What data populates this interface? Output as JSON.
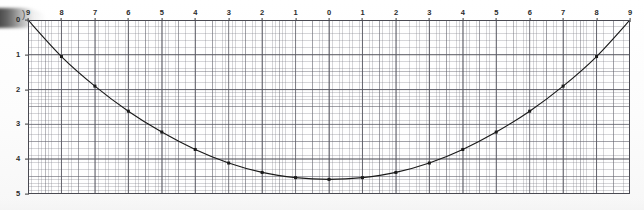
{
  "document": {
    "kind": "scanned-graph-paper",
    "artifact_label": ")",
    "paper_color": "#fdfdfd",
    "grid_color": "#7a7a86",
    "curve_color": "#1a1a1a"
  },
  "axes": {
    "x_ticks": [
      {
        "label": "9",
        "value": -9
      },
      {
        "label": "8",
        "value": -8
      },
      {
        "label": "7",
        "value": -7
      },
      {
        "label": "6",
        "value": -6
      },
      {
        "label": "5",
        "value": -5
      },
      {
        "label": "4",
        "value": -4
      },
      {
        "label": "3",
        "value": -3
      },
      {
        "label": "2",
        "value": -2
      },
      {
        "label": "1",
        "value": -1
      },
      {
        "label": "0",
        "value": 0
      },
      {
        "label": "1",
        "value": 1
      },
      {
        "label": "2",
        "value": 2
      },
      {
        "label": "3",
        "value": 3
      },
      {
        "label": "4",
        "value": 4
      },
      {
        "label": "5",
        "value": 5
      },
      {
        "label": "6",
        "value": 6
      },
      {
        "label": "7",
        "value": 7
      },
      {
        "label": "8",
        "value": 8
      },
      {
        "label": "9",
        "value": 9
      }
    ],
    "y_ticks": [
      {
        "label": "0",
        "value": 0
      },
      {
        "label": "1",
        "value": 1
      },
      {
        "label": "2",
        "value": 2
      },
      {
        "label": "3",
        "value": 3
      },
      {
        "label": "4",
        "value": 4
      },
      {
        "label": "5",
        "value": 5
      }
    ],
    "xlim": [
      -9,
      9
    ],
    "ylim": [
      0,
      5
    ],
    "y_inverted": true
  },
  "chart_data": {
    "type": "line",
    "title": "",
    "subtitle": "",
    "xlabel": "",
    "ylabel": "",
    "grid": true,
    "legend": "none",
    "xlim": [
      -9,
      9
    ],
    "ylim": [
      0,
      5
    ],
    "y_axis_direction": "downward",
    "x": [
      -9,
      -8,
      -7,
      -6,
      -5,
      -4,
      -3,
      -2,
      -1,
      0,
      1,
      2,
      3,
      4,
      5,
      6,
      7,
      8,
      9
    ],
    "categories": [
      "9",
      "8",
      "7",
      "6",
      "5",
      "4",
      "3",
      "2",
      "1",
      "0",
      "1",
      "2",
      "3",
      "4",
      "5",
      "6",
      "7",
      "8",
      "9"
    ],
    "values": [
      0.0,
      1.05,
      1.9,
      2.62,
      3.22,
      3.72,
      4.11,
      4.38,
      4.53,
      4.58,
      4.53,
      4.38,
      4.11,
      3.72,
      3.22,
      2.62,
      1.9,
      1.05,
      0.0
    ],
    "series": [
      {
        "name": "curve",
        "marker": "square",
        "values": [
          0.0,
          1.05,
          1.9,
          2.62,
          3.22,
          3.72,
          4.11,
          4.38,
          4.53,
          4.58,
          4.53,
          4.38,
          4.11,
          3.72,
          3.22,
          2.62,
          1.9,
          1.05,
          0.0
        ]
      }
    ],
    "annotations": []
  }
}
